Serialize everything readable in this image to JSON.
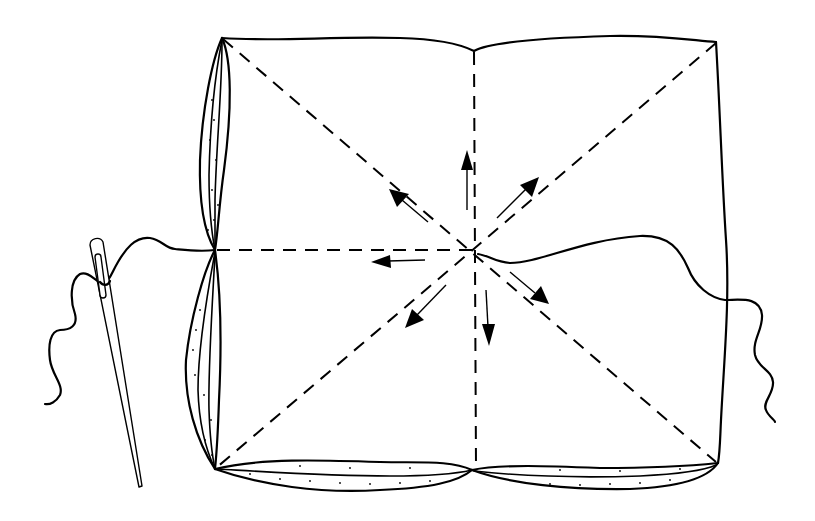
{
  "figure": {
    "description": "Line drawing: square of fabric being gathered at the center with needle and thread; dashed fold lines radiate from the center and arrows show outward smoothing directions",
    "colors": {
      "ink": "#000000",
      "background": "#ffffff"
    },
    "elements": {
      "fabric_square": "fabric-square",
      "fold_lines": [
        "vertical",
        "horizontal",
        "diagonal-tl-br",
        "diagonal-tr-bl"
      ],
      "arrows": [
        "up",
        "up-left",
        "up-right",
        "left",
        "down-left",
        "down",
        "down-right"
      ],
      "needle": "sewing-needle",
      "thread": "sewing-thread"
    }
  }
}
